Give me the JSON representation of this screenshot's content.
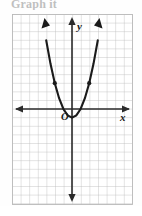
{
  "figure": {
    "header_label": "Graph it",
    "caption": "",
    "background_color": "#fefefe",
    "grid_color": "#b9b9b9",
    "axis_color": "#2b2b2b",
    "curve_color": "#1a1a1a",
    "label_color": "#1a1a1a"
  },
  "axes": {
    "x_axis_label": "x",
    "y_axis_label": "y",
    "origin_label": "O",
    "x_axis_pixel_y": 95,
    "y_axis_pixel_x": 60,
    "grid_spacing_px": 8.6,
    "grid_columns": 14,
    "grid_rows": 22,
    "arrow_heads": [
      "left",
      "right",
      "up",
      "down"
    ],
    "tick_labels_shown": false
  },
  "chart_data": {
    "type": "line",
    "title": "",
    "subtitle": "",
    "xlabel": "x",
    "ylabel": "y",
    "legend_entries": [],
    "legend_position": "none",
    "grid": true,
    "xlim": [
      -7,
      7
    ],
    "ylim": [
      -11,
      11
    ],
    "curve_name": "parabola",
    "equation": "y = x^2 - 1",
    "vertex": [
      0,
      -1
    ],
    "axis_of_symmetry": 0,
    "opens": "up",
    "x": [
      -3,
      -2.5,
      -2,
      -1.5,
      -1,
      -0.5,
      0,
      0.5,
      1,
      1.5,
      2,
      2.5,
      3
    ],
    "y": [
      8,
      5.25,
      3,
      1.25,
      0,
      -0.75,
      -1,
      -0.75,
      0,
      1.25,
      3,
      5.25,
      8
    ],
    "marked_points": [
      {
        "x": -2,
        "y": 3
      },
      {
        "x": 2,
        "y": 3
      }
    ],
    "annotations": [
      {
        "text": "O",
        "x": -0.6,
        "y": -0.9
      },
      {
        "text": "y",
        "x": 0.6,
        "y": 9.6
      },
      {
        "text": "x",
        "x": 6.5,
        "y": -1.1
      }
    ]
  }
}
